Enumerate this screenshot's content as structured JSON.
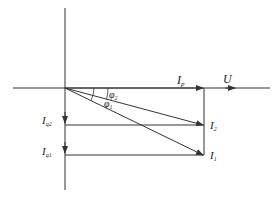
{
  "diagram": {
    "type": "phasor-diagram",
    "labels": {
      "voltage": {
        "main": "U",
        "sub": ""
      },
      "active_current": {
        "main": "I",
        "sub": "p"
      },
      "current_1": {
        "main": "I",
        "sub": "1"
      },
      "current_2": {
        "main": "I",
        "sub": "2"
      },
      "reactive_current_1": {
        "main": "I",
        "sub": "q1"
      },
      "reactive_current_2": {
        "main": "I",
        "sub": "q2"
      },
      "angle_1": {
        "main": "φ",
        "sub": "1"
      },
      "angle_2": {
        "main": "φ",
        "sub": "2"
      }
    },
    "colors": {
      "line": "#333333",
      "text": "#222222",
      "background": "#ffffff"
    }
  }
}
